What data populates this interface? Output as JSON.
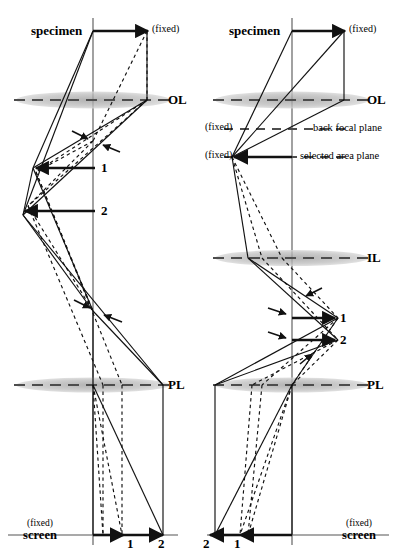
{
  "figure": {
    "type": "optical-ray-diagram",
    "panels": [
      {
        "id": "left",
        "mode": "imaging-mode",
        "axis_x": 93,
        "labels": {
          "specimen": "specimen",
          "specimen_fixed": "(fixed)",
          "ol": "OL",
          "pl": "PL",
          "screen_fixed": "(fixed)",
          "screen": "screen"
        },
        "ray_markers": [
          {
            "label": "1",
            "x": 105,
            "y": 163
          },
          {
            "label": "2",
            "x": 105,
            "y": 205
          }
        ],
        "screen_markers": [
          {
            "label": "1",
            "x": 131,
            "y": 538
          },
          {
            "label": "2",
            "x": 162,
            "y": 538
          }
        ]
      },
      {
        "id": "right",
        "mode": "diffraction-mode",
        "axis_x": 292,
        "labels": {
          "specimen": "specimen",
          "specimen_fixed": "(fixed)",
          "ol": "OL",
          "bfp_fixed": "(fixed)",
          "back_focal_plane": "back focal plane",
          "sap_fixed": "(fixed)",
          "selected_area_plane": "selected area plane",
          "il": "IL",
          "pl": "PL",
          "screen_fixed": "(fixed)",
          "screen": "screen"
        },
        "ray_markers": [
          {
            "label": "1",
            "x": 340,
            "y": 318
          },
          {
            "label": "2",
            "x": 340,
            "y": 340
          }
        ],
        "screen_markers": [
          {
            "label": "2",
            "x": 205,
            "y": 538
          },
          {
            "label": "1",
            "x": 236,
            "y": 538
          }
        ]
      }
    ],
    "lenses": [
      {
        "name": "OL",
        "panel": "left",
        "y": 100
      },
      {
        "name": "PL",
        "panel": "left",
        "y": 385
      },
      {
        "name": "OL",
        "panel": "right",
        "y": 100
      },
      {
        "name": "IL",
        "panel": "right",
        "y": 258
      },
      {
        "name": "PL",
        "panel": "right",
        "y": 385
      }
    ],
    "colors": {
      "ink": "#1a1a1a",
      "lens_fill": "#b8b8b8",
      "lens_dash": "#4d4d4d",
      "background": "#ffffff"
    }
  }
}
